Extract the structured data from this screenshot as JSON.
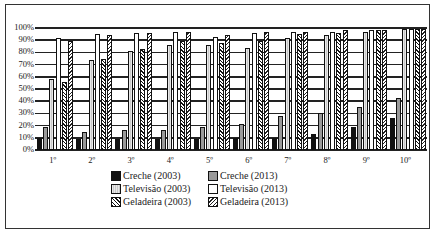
{
  "chart_data": {
    "type": "bar",
    "title": "",
    "xlabel": "",
    "ylabel": "",
    "ylim": [
      0,
      100
    ],
    "yticks": [
      "0%",
      "10%",
      "20%",
      "30%",
      "40%",
      "50%",
      "60%",
      "70%",
      "80%",
      "90%",
      "100%"
    ],
    "categories": [
      "1º",
      "2º",
      "3º",
      "4º",
      "5º",
      "6º",
      "7º",
      "8º",
      "9º",
      "10º"
    ],
    "grid": true,
    "legend_position": "bottom",
    "series": [
      {
        "name": "Creche (2003)",
        "values": [
          10,
          9,
          9,
          9,
          9,
          10,
          10,
          13,
          19,
          26
        ]
      },
      {
        "name": "Creche (2013)",
        "values": [
          19,
          15,
          16,
          16,
          19,
          21,
          28,
          30,
          35,
          43
        ]
      },
      {
        "name": "Televisão (2003)",
        "values": [
          58,
          74,
          81,
          86,
          86,
          84,
          92,
          94,
          97,
          99
        ]
      },
      {
        "name": "Televisão (2013)",
        "values": [
          92,
          95,
          96,
          97,
          93,
          96,
          97,
          97,
          98,
          99
        ]
      },
      {
        "name": "Geladeira (2003)",
        "values": [
          56,
          75,
          83,
          89,
          88,
          89,
          95,
          96,
          98,
          99
        ]
      },
      {
        "name": "Geladeira (2013)",
        "values": [
          89,
          94,
          96,
          97,
          94,
          97,
          97,
          98,
          98,
          99
        ]
      }
    ]
  },
  "legend": [
    {
      "label": "Creche (2003)",
      "icon": "solid-black-swatch"
    },
    {
      "label": "Creche (2013)",
      "icon": "gray-swatch"
    },
    {
      "label": "Televisão (2003)",
      "icon": "light-striped-swatch"
    },
    {
      "label": "Televisão (2013)",
      "icon": "white-swatch"
    },
    {
      "label": "Geladeira (2003)",
      "icon": "dense-hatch-swatch"
    },
    {
      "label": "Geladeira (2013)",
      "icon": "diagonal-hatch-swatch"
    }
  ]
}
